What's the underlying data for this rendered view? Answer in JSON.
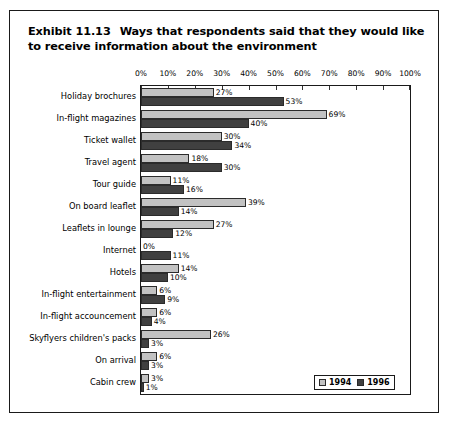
{
  "exhibit": {
    "number": "Exhibit 11.13",
    "title": "Ways that respondents said that they would like to receive information about the environment"
  },
  "legend": {
    "items": [
      {
        "label": "1994",
        "color": "#c2c2c2"
      },
      {
        "label": "1996",
        "color": "#404040"
      }
    ]
  },
  "chart_data": {
    "type": "bar",
    "orientation": "horizontal",
    "title": "Ways that respondents said that they would like to receive information about the environment",
    "xlabel": "",
    "ylabel": "",
    "xlim": [
      0,
      100
    ],
    "xticks": [
      0,
      10,
      20,
      30,
      40,
      50,
      60,
      70,
      80,
      90,
      100
    ],
    "xtick_labels": [
      "0%",
      "10%",
      "20%",
      "30%",
      "40%",
      "50%",
      "60%",
      "70%",
      "80%",
      "90%",
      "100%"
    ],
    "grid": false,
    "legend_position": "bottom-right",
    "value_suffix": "%",
    "categories": [
      "Holiday brochures",
      "In-flight magazines",
      "Ticket wallet",
      "Travel agent",
      "Tour guide",
      "On board leaflet",
      "Leaflets in lounge",
      "Internet",
      "Hotels",
      "In-flight entertainment",
      "In-flight accouncement",
      "Skyflyers children's packs",
      "On arrival",
      "Cabin crew"
    ],
    "series": [
      {
        "name": "1994",
        "color": "#c2c2c2",
        "values": [
          27,
          69,
          30,
          18,
          11,
          39,
          27,
          0,
          14,
          6,
          6,
          26,
          6,
          3
        ],
        "labels": [
          "27%",
          "69%",
          "30%",
          "18%",
          "11%",
          "39%",
          "27%",
          "0%",
          "14%",
          "6%",
          "6%",
          "26%",
          "6%",
          "3%"
        ]
      },
      {
        "name": "1996",
        "color": "#404040",
        "values": [
          53,
          40,
          34,
          30,
          16,
          14,
          12,
          11,
          10,
          9,
          4,
          3,
          3,
          1
        ],
        "labels": [
          "53%",
          "40%",
          "34%",
          "30%",
          "16%",
          "14%",
          "12%",
          "11%",
          "10%",
          "9%",
          "4%",
          "3%",
          "3%",
          "1%"
        ]
      }
    ]
  }
}
